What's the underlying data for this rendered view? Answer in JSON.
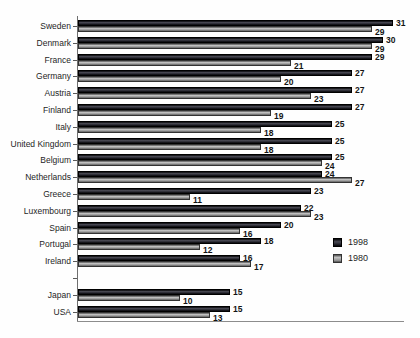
{
  "chart_data": {
    "type": "bar",
    "orientation": "horizontal",
    "title": "",
    "xlabel": "",
    "ylabel": "",
    "xlim": [
      0,
      32
    ],
    "grid": false,
    "legend_position": "right-center",
    "value_labels": true,
    "categories": [
      "Sweden",
      "Denmark",
      "France",
      "Germany",
      "Austria",
      "Finland",
      "Italy",
      "United Kingdom",
      "Belgium",
      "Netherlands",
      "Greece",
      "Luxembourg",
      "Spain",
      "Portugal",
      "Ireland",
      "Japan",
      "USA"
    ],
    "gap_after_index": 14,
    "series": [
      {
        "name": "1998",
        "color": "#26262e",
        "values": [
          31,
          30,
          29,
          27,
          27,
          27,
          25,
          25,
          25,
          24,
          23,
          22,
          20,
          18,
          16,
          15,
          15
        ]
      },
      {
        "name": "1980",
        "color": "#9a9a9a",
        "values": [
          29,
          29,
          21,
          20,
          23,
          19,
          18,
          18,
          24,
          27,
          11,
          23,
          16,
          12,
          17,
          10,
          13
        ]
      }
    ]
  },
  "legend": {
    "items": [
      {
        "label": "1998",
        "color": "#26262e"
      },
      {
        "label": "1980",
        "color": "#9a9a9a"
      }
    ]
  },
  "colors": {
    "background": "#fefefe",
    "axis": "#6f6f6f",
    "baseline": "#8c8c8c",
    "text": "#1f1f1f"
  }
}
